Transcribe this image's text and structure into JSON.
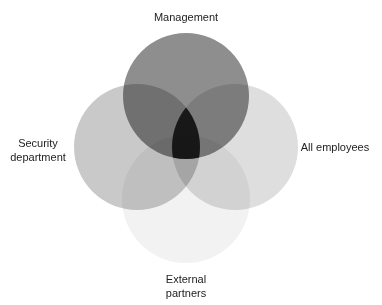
{
  "diagram": {
    "type": "venn",
    "sets": [
      {
        "id": "management",
        "label": "Management",
        "cx": 186,
        "cy": 96,
        "r": 63,
        "fill": "#8e8e8e"
      },
      {
        "id": "security",
        "label": "Security department",
        "label_lines": [
          "Security",
          "department"
        ],
        "cx": 137,
        "cy": 147,
        "r": 63,
        "fill": "#c9c9c9"
      },
      {
        "id": "employees",
        "label": "All employees",
        "cx": 235,
        "cy": 147,
        "r": 63,
        "fill": "#dedede"
      },
      {
        "id": "external",
        "label": "External partners",
        "label_lines": [
          "External",
          "partners"
        ],
        "cx": 186,
        "cy": 199,
        "r": 64,
        "fill": "#f2f2f2"
      }
    ],
    "center_fill": "#000000"
  },
  "labels": {
    "management": "Management",
    "security_1": "Security",
    "security_2": "department",
    "employees": "All employees",
    "external_1": "External",
    "external_2": "partners"
  }
}
